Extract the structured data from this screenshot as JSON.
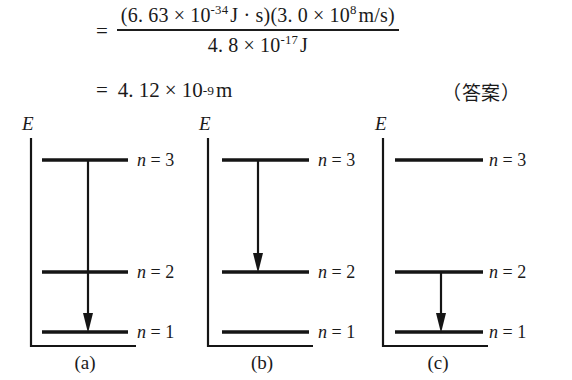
{
  "equation": {
    "equals_sign": "=",
    "numerator": {
      "factor1": {
        "open": "(",
        "mantissa": "6. 63",
        "times": "×",
        "base": "10",
        "exponent": "-34",
        "unit": "J · s",
        "close": ")"
      },
      "factor2": {
        "open": "(",
        "mantissa": "3. 0",
        "times": "×",
        "base": "10",
        "exponent": "8",
        "unit": "m/s",
        "close": ")"
      }
    },
    "denominator": {
      "mantissa": "4. 8",
      "times": "×",
      "base": "10",
      "exponent": "-17",
      "unit": "J"
    },
    "result": {
      "equals_sign": "=",
      "mantissa": "4. 12",
      "times": "×",
      "base": "10",
      "exponent": "-9",
      "unit": "m"
    },
    "answer_note": "（答案）"
  },
  "diagrams": {
    "axis_symbol": "E",
    "levels": {
      "n3": "n = 3",
      "n2": "n = 2",
      "n1": "n = 1"
    },
    "level_label_prefix": "n",
    "items": [
      {
        "id": "a",
        "caption": "(a)",
        "transition": {
          "from": "n = 3",
          "to": "n = 1"
        }
      },
      {
        "id": "b",
        "caption": "(b)",
        "transition": {
          "from": "n = 3",
          "to": "n = 2"
        }
      },
      {
        "id": "c",
        "caption": "(c)",
        "transition": {
          "from": "n = 2",
          "to": "n = 1"
        }
      }
    ]
  },
  "colors": {
    "ink": "#151515",
    "page": "#ffffff"
  }
}
